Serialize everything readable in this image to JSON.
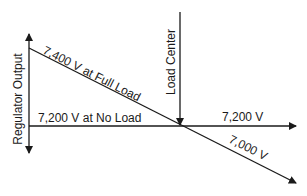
{
  "diagram": {
    "labels": {
      "regulator_output": "Regulator Output",
      "load_center": "Load Center",
      "full_load": "7,400 V at Full Load",
      "no_load": "7,200 V at No Load",
      "right_no_load": "7,200 V",
      "right_full_load": "7,000 V"
    },
    "colors": {
      "line": "#1a1a1a",
      "background": "#ffffff"
    }
  }
}
